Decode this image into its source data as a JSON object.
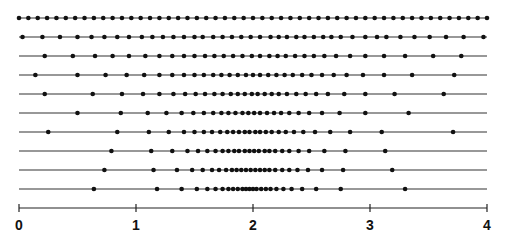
{
  "figure": {
    "colors": {
      "line": "#333333",
      "dot": "#111111",
      "axis": "#222222",
      "background": "#ffffff"
    },
    "layout": {
      "x0_px": 19,
      "px_per_unit": 117,
      "row_y_px": [
        18,
        37,
        56,
        75,
        94,
        113,
        132,
        151,
        170,
        189
      ],
      "axis_y_px": 208,
      "dot_radius_px": 2.3
    }
  },
  "axis": {
    "range": [
      0,
      4
    ],
    "ticks": [
      0,
      1,
      2,
      3,
      4
    ],
    "tick_labels": [
      "0",
      "1",
      "2",
      "3",
      "4"
    ]
  },
  "rows": [
    {
      "name": "row-1",
      "points": [
        0.0,
        0.08,
        0.16,
        0.24,
        0.32,
        0.4,
        0.48,
        0.56,
        0.64,
        0.72,
        0.8,
        0.88,
        0.96,
        1.04,
        1.12,
        1.2,
        1.28,
        1.36,
        1.44,
        1.52,
        1.6,
        1.68,
        1.76,
        1.84,
        1.92,
        2.0,
        2.08,
        2.16,
        2.24,
        2.32,
        2.4,
        2.48,
        2.56,
        2.64,
        2.72,
        2.8,
        2.88,
        2.96,
        3.04,
        3.12,
        3.2,
        3.28,
        3.36,
        3.44,
        3.52,
        3.6,
        3.68,
        3.76,
        3.84,
        3.92,
        4.0
      ]
    },
    {
      "name": "row-2",
      "points": [
        0.03,
        0.2,
        0.35,
        0.5,
        0.62,
        0.73,
        0.84,
        0.94,
        1.05,
        1.14,
        1.23,
        1.32,
        1.41,
        1.5,
        1.57,
        1.66,
        1.74,
        1.82,
        1.9,
        1.98,
        2.06,
        2.15,
        2.22,
        2.29,
        2.37,
        2.44,
        2.52,
        2.6,
        2.67,
        2.75,
        2.85,
        2.96,
        3.06,
        3.14,
        3.26,
        3.38,
        3.51,
        3.65,
        3.8,
        3.97
      ]
    },
    {
      "name": "row-3",
      "points": [
        0.22,
        0.46,
        0.65,
        0.8,
        0.94,
        1.08,
        1.2,
        1.31,
        1.41,
        1.5,
        1.59,
        1.67,
        1.75,
        1.83,
        1.91,
        1.99,
        2.06,
        2.14,
        2.21,
        2.28,
        2.36,
        2.44,
        2.52,
        2.61,
        2.71,
        2.83,
        2.96,
        3.12,
        3.3,
        3.54,
        3.78
      ]
    },
    {
      "name": "row-4",
      "points": [
        0.14,
        0.5,
        0.74,
        0.92,
        1.07,
        1.2,
        1.31,
        1.41,
        1.5,
        1.58,
        1.66,
        1.73,
        1.8,
        1.87,
        1.94,
        2.0,
        2.06,
        2.13,
        2.2,
        2.27,
        2.34,
        2.42,
        2.5,
        2.59,
        2.69,
        2.8,
        2.94,
        3.12,
        3.36,
        3.72
      ]
    },
    {
      "name": "row-5",
      "points": [
        0.22,
        0.63,
        0.88,
        1.06,
        1.2,
        1.32,
        1.42,
        1.51,
        1.59,
        1.67,
        1.74,
        1.81,
        1.87,
        1.93,
        1.99,
        2.04,
        2.1,
        2.16,
        2.22,
        2.29,
        2.37,
        2.45,
        2.54,
        2.64,
        2.78,
        2.96,
        3.21,
        3.63
      ]
    },
    {
      "name": "row-6",
      "points": [
        0.5,
        0.87,
        1.1,
        1.26,
        1.39,
        1.49,
        1.58,
        1.66,
        1.73,
        1.79,
        1.85,
        1.91,
        1.96,
        2.01,
        2.06,
        2.12,
        2.18,
        2.24,
        2.31,
        2.39,
        2.48,
        2.59,
        2.74,
        2.96,
        3.33
      ]
    },
    {
      "name": "row-7",
      "points": [
        0.25,
        0.84,
        1.11,
        1.28,
        1.41,
        1.5,
        1.58,
        1.65,
        1.72,
        1.78,
        1.83,
        1.88,
        1.93,
        1.97,
        2.02,
        2.06,
        2.11,
        2.16,
        2.22,
        2.28,
        2.35,
        2.43,
        2.53,
        2.66,
        2.83,
        3.1,
        3.71
      ]
    },
    {
      "name": "row-8",
      "points": [
        0.79,
        1.13,
        1.31,
        1.44,
        1.53,
        1.61,
        1.68,
        1.74,
        1.79,
        1.84,
        1.88,
        1.93,
        1.97,
        2.01,
        2.05,
        2.1,
        2.14,
        2.19,
        2.25,
        2.31,
        2.39,
        2.48,
        2.61,
        2.79,
        3.13
      ]
    },
    {
      "name": "row-9",
      "points": [
        0.73,
        1.15,
        1.35,
        1.48,
        1.57,
        1.65,
        1.71,
        1.77,
        1.82,
        1.86,
        1.9,
        1.94,
        1.98,
        2.02,
        2.06,
        2.1,
        2.14,
        2.19,
        2.25,
        2.31,
        2.38,
        2.47,
        2.59,
        2.77,
        3.19
      ]
    },
    {
      "name": "row-10",
      "points": [
        0.64,
        1.18,
        1.39,
        1.52,
        1.61,
        1.68,
        1.74,
        1.79,
        1.83,
        1.87,
        1.91,
        1.94,
        1.97,
        2.0,
        2.03,
        2.07,
        2.11,
        2.15,
        2.2,
        2.26,
        2.33,
        2.42,
        2.54,
        2.75,
        3.3
      ]
    }
  ]
}
